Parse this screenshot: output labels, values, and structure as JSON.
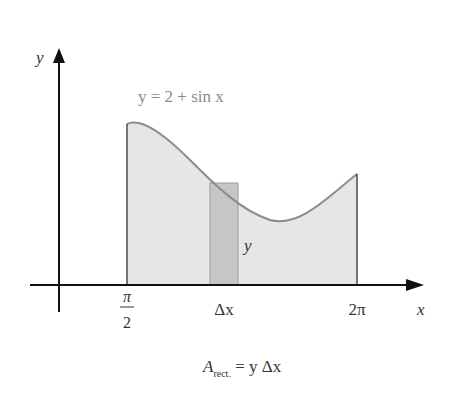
{
  "figure": {
    "function_label": "y = 2 + sin x",
    "y_axis_label": "y",
    "x_axis_label": "x",
    "ticks": {
      "left_num": "π",
      "left_den": "2",
      "mid": "Δx",
      "right": "2π"
    },
    "rect_height_label": "y",
    "caption_main": "A",
    "caption_sub": "rect.",
    "caption_rest": " = y Δx"
  },
  "colors": {
    "region_fill": "#e6e6e6",
    "rect_fill": "#c8c8c8",
    "curve": "#8c8c8c",
    "axis": "#111111",
    "label_gray": "#8a8a8a"
  }
}
